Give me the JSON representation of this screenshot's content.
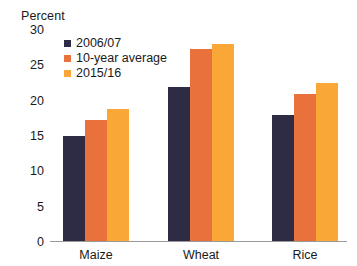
{
  "chart_data": {
    "type": "bar",
    "title": "",
    "subtitle": "",
    "xlabel": "",
    "ylabel": "Percent",
    "ylim": [
      0,
      30
    ],
    "yticks": [
      0,
      5,
      10,
      15,
      20,
      25,
      30
    ],
    "ytick_labels": [
      "0",
      "5",
      "10",
      "15",
      "20",
      "25",
      "30"
    ],
    "grid": false,
    "legend_position": "top-left-inside",
    "categories": [
      "Maize",
      "Wheat",
      "Rice"
    ],
    "series": [
      {
        "name": "2006/07",
        "color": "#2e2b45",
        "values": [
          15.0,
          22.0,
          18.0
        ]
      },
      {
        "name": "10-year average",
        "color": "#e8713c",
        "values": [
          17.3,
          27.3,
          21.0
        ]
      },
      {
        "name": "2015/16",
        "color": "#f9a838",
        "values": [
          18.8,
          28.0,
          22.5
        ]
      }
    ]
  },
  "colors": {
    "series_2006_07": "#2e2b45",
    "series_10_year_average": "#e8713c",
    "series_2015_16": "#f9a838",
    "axis_line": "#9a9a9a",
    "text": "#1a1a1a",
    "background": "#ffffff"
  }
}
